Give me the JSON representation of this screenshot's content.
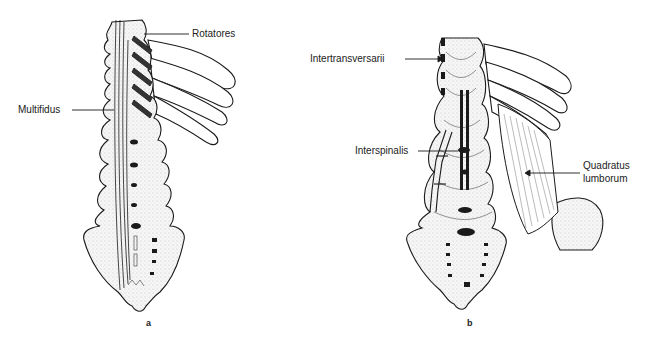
{
  "figure": {
    "panels": [
      {
        "id": "a",
        "letter": "a",
        "labels": {
          "rotatores": "Rotatores",
          "multifidus": "Multifidus"
        }
      },
      {
        "id": "b",
        "letter": "b",
        "labels": {
          "intertransversarii": "Intertransversarii",
          "interspinalis": "Interspinalis",
          "quadratus_line1": "Quadratus",
          "quadratus_line2": "lumborum"
        }
      }
    ],
    "colors": {
      "ink": "#1a1a1a",
      "bone_fill": "#f4f4f4",
      "background": "#ffffff"
    }
  }
}
